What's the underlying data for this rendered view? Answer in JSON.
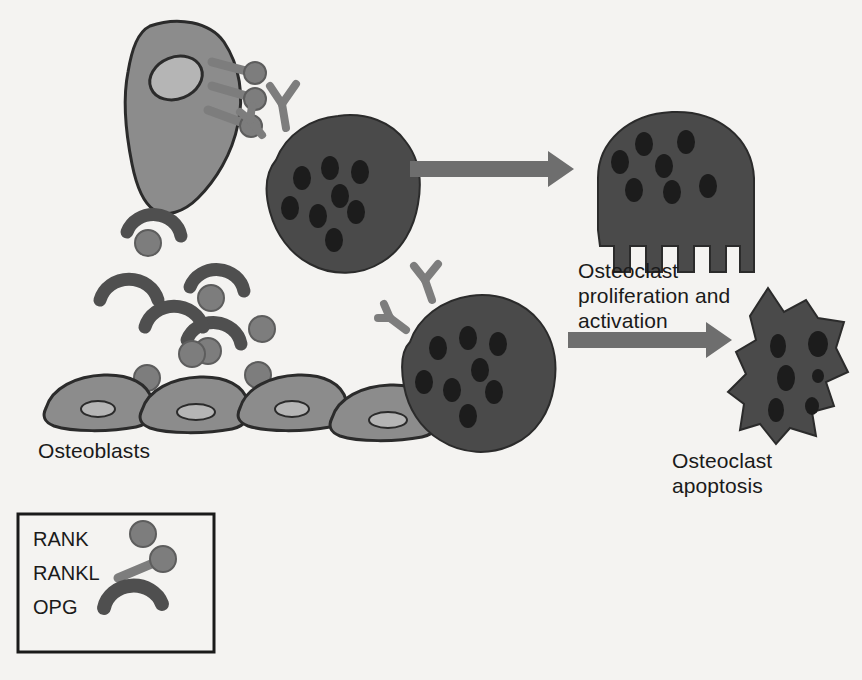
{
  "figure": {
    "background_color": "#f4f3f1"
  },
  "palette": {
    "osteoblast_fill": "#8c8c8c",
    "osteoblast_nucleus": "#b5b5b5",
    "osteoclast_fill": "#4a4a4a",
    "osteoclast_nucleus": "#1c1c1c",
    "molecule_gray": "#7d7d7d",
    "opg_dark": "#4f4f4f",
    "arrow_gray": "#6e6e6e",
    "outline": "#2b2b2b",
    "text": "#1a1a1a"
  },
  "labels": {
    "osteoblasts": "Osteoblasts",
    "proliferation": "Osteoclast\nproliferation and\nactivation",
    "apoptosis": "Osteoclast\napoptosis"
  },
  "legend": {
    "items": [
      {
        "label": "RANK",
        "icon": "rank-circle-icon"
      },
      {
        "label": "RANKL",
        "icon": "rankl-stalk-icon"
      },
      {
        "label": "OPG",
        "icon": "opg-arc-icon"
      }
    ]
  },
  "cells": {
    "osteoblast_signaling": {
      "name": "signaling-osteoblast",
      "rankl_count": 3
    },
    "osteoblast_row": {
      "name": "osteoblast-row",
      "count": 4
    },
    "osteoclast_bound": {
      "name": "rankl-bound-osteoclast",
      "nuclei": 8,
      "rank_receptors": 2
    },
    "osteoclast_opg_blocked": {
      "name": "opg-blocked-osteoclast",
      "nuclei": 8,
      "rank_receptors": 2
    },
    "osteoclast_activated": {
      "name": "activated-osteoclast",
      "nuclei": 7,
      "feature": "ruffled-border"
    },
    "osteoclast_apoptotic": {
      "name": "apoptotic-osteoclast",
      "nuclei": 6,
      "feature": "shrunken-irregular"
    }
  },
  "molecules": {
    "free_rank_count": 4,
    "opg_arc_count": 5,
    "opg_bound_rank_count": 3
  },
  "arrows": [
    {
      "name": "arrow-activation",
      "from": "rankl-bound-osteoclast",
      "to": "activated-osteoclast"
    },
    {
      "name": "arrow-apoptosis",
      "from": "opg-blocked-osteoclast",
      "to": "apoptotic-osteoclast"
    }
  ]
}
